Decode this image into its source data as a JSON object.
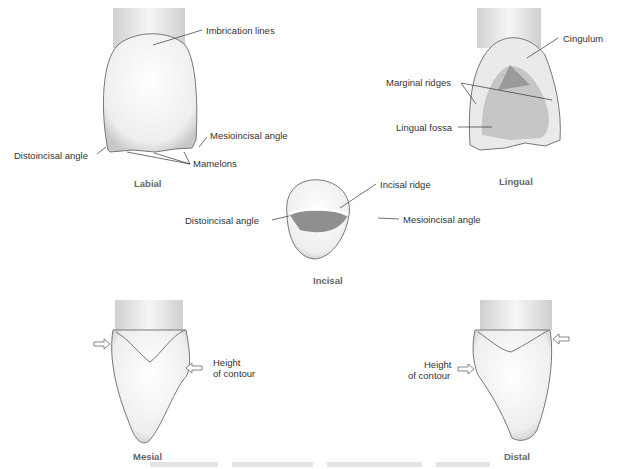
{
  "views": {
    "labial": {
      "title": "Labial",
      "labels": [
        "Imbrication lines",
        "Mesioincisal angle",
        "Distoincisal angle",
        "Mamelons"
      ]
    },
    "lingual": {
      "title": "Lingual",
      "labels": [
        "Cingulum",
        "Marginal ridges",
        "Lingual fossa"
      ]
    },
    "incisal": {
      "title": "Incisal",
      "labels": [
        "Incisal ridge",
        "Distoincisal angle",
        "Mesioincisal  angle"
      ]
    },
    "mesial": {
      "title": "Mesial",
      "labels": [
        "Height",
        "of contour"
      ]
    },
    "distal": {
      "title": "Distal",
      "labels": [
        "Height",
        "of contour"
      ]
    }
  },
  "colors": {
    "outline": "#555555",
    "shade": "#bbbbbb",
    "fossa": "#8a8a8a",
    "text": "#333333"
  }
}
